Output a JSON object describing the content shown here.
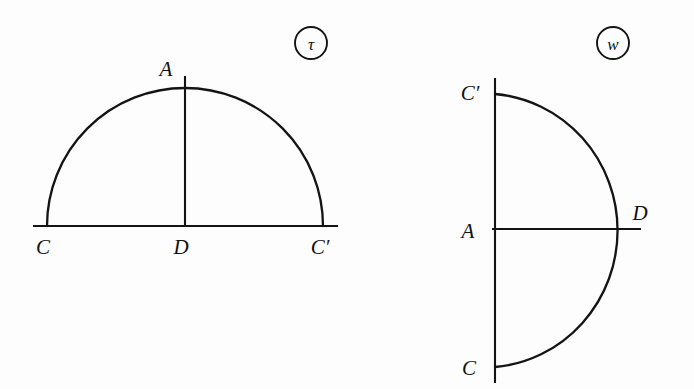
{
  "figure": {
    "kind": "geometry-diagram-pair",
    "background_color": "#fdfdfd",
    "ink_color": "#141414",
    "panels": [
      {
        "id": "panel-tau",
        "tag": "τ",
        "tag_name": "tau",
        "tag_center": {
          "x": 311,
          "y": 43
        },
        "tag_radius": 16,
        "description": "Semicircle standing on a horizontal diameter with a vertical radius drawn to the apex",
        "orientation": "arc-above-horizontal-diameter",
        "baseline": {
          "x1": 33,
          "y1": 226,
          "x2": 338,
          "y2": 226
        },
        "arc": {
          "cx": 185,
          "cy": 226,
          "r": 138,
          "from_deg": 180,
          "to_deg": 360
        },
        "radius_line": {
          "x1": 185,
          "y1": 76,
          "x2": 185,
          "y2": 227
        },
        "points": [
          {
            "label": "A",
            "name": "point-a",
            "x": 185,
            "y": 88,
            "label_x": 166,
            "label_y": 76,
            "role": "apex"
          },
          {
            "label": "C",
            "name": "point-c",
            "x": 48,
            "y": 226,
            "label_x": 43,
            "label_y": 254,
            "role": "arc-endpoint-left"
          },
          {
            "label": "D",
            "name": "point-d",
            "x": 185,
            "y": 226,
            "label_x": 181,
            "label_y": 254,
            "role": "center-foot"
          },
          {
            "label": "C′",
            "name": "point-c-prime",
            "x": 323,
            "y": 226,
            "label_x": 317,
            "label_y": 254,
            "role": "arc-endpoint-right"
          }
        ]
      },
      {
        "id": "panel-w",
        "tag": "w",
        "tag_name": "w",
        "tag_center": {
          "x": 613,
          "y": 43
        },
        "tag_radius": 16,
        "description": "Semicircle rotated a quarter turn: vertical diameter on the left, arc bulging to the right, horizontal radius drawn to the arc",
        "orientation": "arc-right-of-vertical-diameter",
        "baseline": {
          "x1": 495,
          "y1": 78,
          "x2": 495,
          "y2": 383
        },
        "arc": {
          "cx": 495,
          "cy": 230,
          "r": 135,
          "from_deg": 270,
          "to_deg": 90
        },
        "radius_line": {
          "x1": 492,
          "y1": 229,
          "x2": 641,
          "y2": 229
        },
        "points": [
          {
            "label": "C′",
            "name": "point-c-prime",
            "x": 495,
            "y": 93,
            "label_x": 459,
            "label_y": 100,
            "role": "arc-endpoint-top"
          },
          {
            "label": "A",
            "name": "point-a",
            "x": 495,
            "y": 230,
            "label_x": 462,
            "label_y": 238,
            "role": "center"
          },
          {
            "label": "D",
            "name": "point-d",
            "x": 627,
            "y": 229,
            "label_x": 633,
            "label_y": 220,
            "role": "arc-apex"
          },
          {
            "label": "C",
            "name": "point-c",
            "x": 495,
            "y": 368,
            "label_x": 463,
            "label_y": 375,
            "role": "arc-endpoint-bottom"
          }
        ]
      }
    ]
  }
}
